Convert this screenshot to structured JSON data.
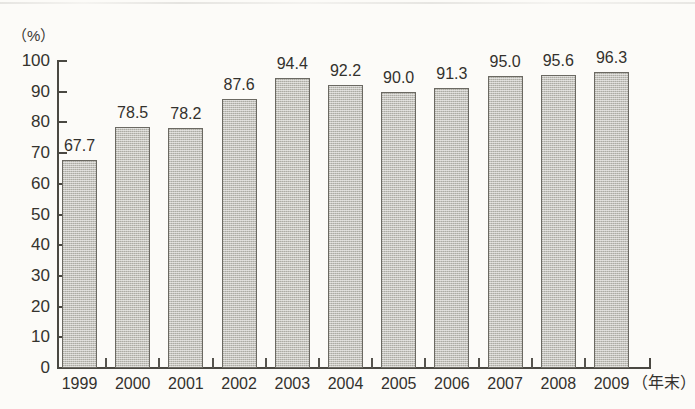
{
  "chart_data": {
    "type": "bar",
    "title": "",
    "subtitle": "",
    "xlabel": "（年末）",
    "ylabel": "（%）",
    "categories": [
      "1999",
      "2000",
      "2001",
      "2002",
      "2003",
      "2004",
      "2005",
      "2006",
      "2007",
      "2008",
      "2009"
    ],
    "values": [
      67.7,
      78.5,
      78.2,
      87.6,
      94.4,
      92.2,
      90.0,
      91.3,
      95.0,
      95.6,
      96.3
    ],
    "value_labels": [
      "67.7",
      "78.5",
      "78.2",
      "87.6",
      "94.4",
      "92.2",
      "90.0",
      "91.3",
      "95.0",
      "95.6",
      "96.3"
    ],
    "ylim": [
      0,
      100
    ],
    "ytick_step": 10,
    "ytick_labels": [
      "100",
      "90",
      "80",
      "70",
      "60",
      "50",
      "40",
      "30",
      "20",
      "10",
      "0"
    ],
    "grid": false,
    "legend": null,
    "series": [
      {
        "name": "",
        "values": [
          67.7,
          78.5,
          78.2,
          87.6,
          94.4,
          92.2,
          90.0,
          91.3,
          95.0,
          95.6,
          96.3
        ]
      }
    ],
    "colors": {
      "bar_fill": "#c3c2bb",
      "bar_outline": "#6b6962",
      "axis": "#4a4842",
      "text": "#33312d",
      "background": "#fcfbf8"
    }
  },
  "axes": {
    "y_unit_label": "（%）",
    "x_caption": "（年末）"
  }
}
